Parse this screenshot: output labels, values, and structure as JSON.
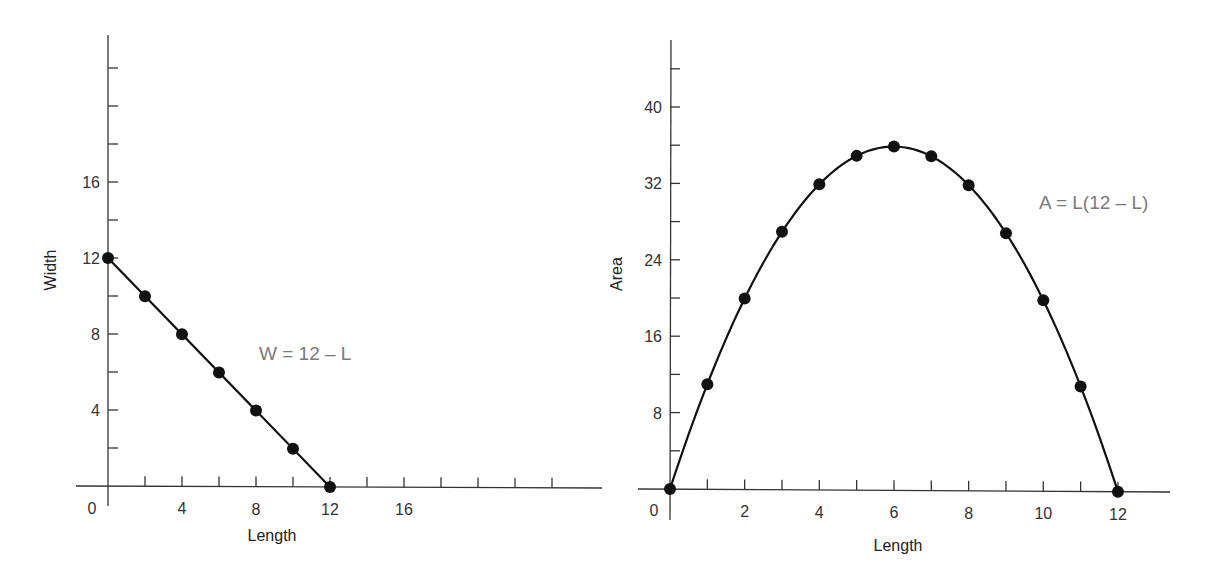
{
  "chart_data": [
    {
      "type": "line",
      "title": "",
      "xlabel": "Length",
      "ylabel": "Width",
      "annotation": "W = 12 – L",
      "x": [
        0,
        2,
        4,
        6,
        8,
        10,
        12
      ],
      "series": [
        {
          "name": "W = 12 – L",
          "values": [
            12,
            10,
            8,
            6,
            4,
            2,
            0
          ]
        }
      ],
      "xlim": [
        0,
        26
      ],
      "ylim": [
        0,
        24
      ],
      "x_tick_labels": [
        "0",
        "4",
        "8",
        "12",
        "16"
      ],
      "y_tick_labels": [
        "4",
        "8",
        "12",
        "16"
      ],
      "grid": false,
      "legend": "none"
    },
    {
      "type": "line",
      "title": "",
      "xlabel": "Length",
      "ylabel": "Area",
      "annotation": "A = L(12 – L)",
      "x": [
        0,
        1,
        2,
        3,
        4,
        5,
        6,
        7,
        8,
        9,
        10,
        11,
        12
      ],
      "series": [
        {
          "name": "A = L(12 – L)",
          "values": [
            0,
            11,
            20,
            27,
            32,
            35,
            36,
            35,
            32,
            27,
            20,
            11,
            0
          ]
        }
      ],
      "xlim": [
        0,
        13.5
      ],
      "ylim": [
        0,
        46
      ],
      "x_tick_labels": [
        "0",
        "2",
        "4",
        "6",
        "8",
        "10",
        "12"
      ],
      "y_tick_labels": [
        "8",
        "16",
        "24",
        "32",
        "40"
      ],
      "grid": false,
      "legend": "none"
    }
  ],
  "left": {
    "xlabel": "Length",
    "ylabel": "Width",
    "equation": "W = 12 – L",
    "origin_label": "0",
    "x_ticks": [
      {
        "v": 4,
        "label": "4"
      },
      {
        "v": 8,
        "label": "8"
      },
      {
        "v": 12,
        "label": "12"
      },
      {
        "v": 16,
        "label": "16"
      }
    ],
    "y_ticks": [
      {
        "v": 4,
        "label": "4"
      },
      {
        "v": 8,
        "label": "8"
      },
      {
        "v": 12,
        "label": "12"
      },
      {
        "v": 16,
        "label": "16"
      }
    ]
  },
  "right": {
    "xlabel": "Length",
    "ylabel": "Area",
    "equation": "A = L(12 – L)",
    "origin_label": "0",
    "x_ticks": [
      {
        "v": 2,
        "label": "2"
      },
      {
        "v": 4,
        "label": "4"
      },
      {
        "v": 6,
        "label": "6"
      },
      {
        "v": 8,
        "label": "8"
      },
      {
        "v": 10,
        "label": "10"
      },
      {
        "v": 12,
        "label": "12"
      }
    ],
    "y_ticks": [
      {
        "v": 8,
        "label": "8"
      },
      {
        "v": 16,
        "label": "16"
      },
      {
        "v": 24,
        "label": "24"
      },
      {
        "v": 32,
        "label": "32"
      },
      {
        "v": 40,
        "label": "40"
      }
    ]
  }
}
